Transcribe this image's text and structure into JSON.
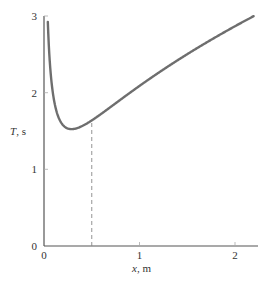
{
  "chart_data": {
    "type": "line",
    "title": "",
    "xlabel": "x, m",
    "ylabel": "T, s",
    "xlabel_var": "x",
    "xlabel_unit": ", m",
    "ylabel_var": "T",
    "ylabel_unit": ", s",
    "xlim": [
      0,
      2.25
    ],
    "ylim": [
      0,
      3
    ],
    "xticks": [
      0,
      1,
      2
    ],
    "yticks": [
      0,
      1,
      2,
      3
    ],
    "grid": false,
    "series": [
      {
        "name": "T(x)",
        "color": "#6e6e6e",
        "x": [
          0.04,
          0.06,
          0.08,
          0.1,
          0.12,
          0.15,
          0.2,
          0.25,
          0.29,
          0.35,
          0.4,
          0.5,
          0.6,
          0.7,
          0.8,
          1.0,
          1.2,
          1.4,
          1.6,
          1.8,
          2.0,
          2.2
        ],
        "y": [
          2.93,
          2.44,
          2.17,
          2.0,
          1.87,
          1.75,
          1.62,
          1.55,
          1.53,
          1.54,
          1.57,
          1.64,
          1.73,
          1.82,
          1.92,
          2.1,
          2.28,
          2.45,
          2.61,
          2.76,
          2.91,
          3.05
        ]
      }
    ],
    "annotations": [
      {
        "type": "vertical-dashed-line",
        "x": 0.5,
        "y_top": 1.64,
        "color": "#888888"
      }
    ]
  },
  "labels": {
    "x_tick_0": "0",
    "x_tick_1": "1",
    "x_tick_2": "2",
    "y_tick_0": "0",
    "y_tick_1": "1",
    "y_tick_2": "2",
    "y_tick_3": "3"
  }
}
